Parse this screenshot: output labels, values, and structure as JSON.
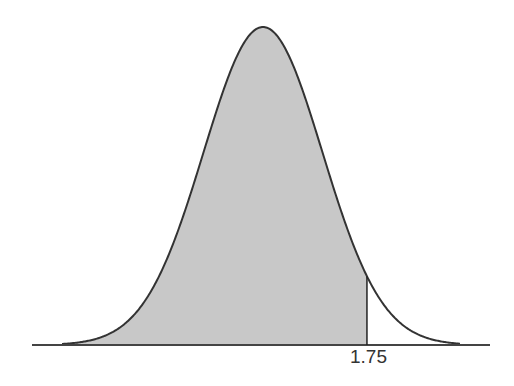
{
  "chart_data": {
    "type": "area",
    "title": "",
    "xlabel": "",
    "ylabel": "",
    "distribution": "standard normal",
    "mean": 0,
    "std": 1,
    "shaded_region": {
      "from": "-inf",
      "to": 1.75
    },
    "tick_labels": [
      "1.75"
    ],
    "xlim": [
      -3.9,
      3.8
    ],
    "grid": false,
    "legend": null
  },
  "colors": {
    "shade": "#c8c8c8",
    "curve": "#333333",
    "axis": "#444444",
    "background": "#ffffff"
  },
  "labels": {
    "z_value": "1.75"
  }
}
